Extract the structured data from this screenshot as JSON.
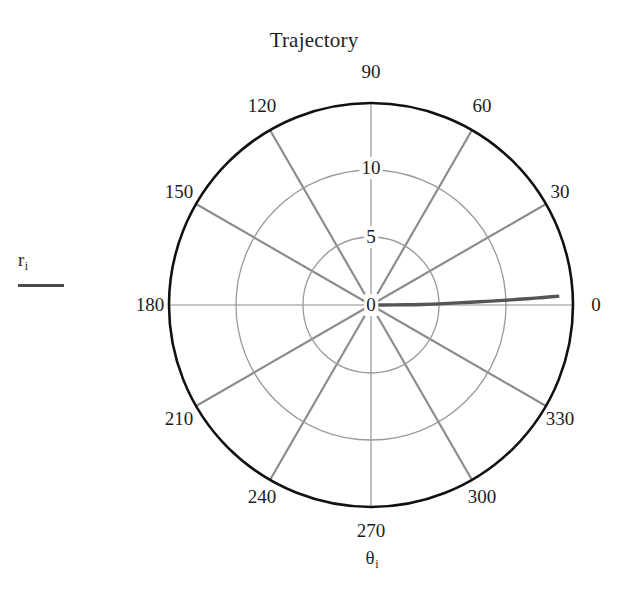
{
  "chart_data": {
    "type": "line",
    "projection": "polar",
    "title": "Trajectory",
    "xlabel": "θ",
    "xlabel_sub": "i",
    "ylabel": "r",
    "ylabel_sub": "i",
    "theta_unit": "degrees",
    "theta_ticks": [
      0,
      30,
      60,
      90,
      120,
      150,
      180,
      210,
      240,
      270,
      300,
      330
    ],
    "theta_tick_labels": [
      "0",
      "30",
      "60",
      "90",
      "120",
      "150",
      "180",
      "210",
      "240",
      "270",
      "300",
      "330"
    ],
    "r_ticks": [
      0,
      5,
      10
    ],
    "r_tick_labels": [
      "0",
      "5",
      "10"
    ],
    "rlim": [
      0,
      15
    ],
    "grid": true,
    "legend_position": "left",
    "series": [
      {
        "name": "r_i",
        "color": "#555555",
        "theta": [
          0.0,
          0.1,
          0.2,
          0.3,
          0.4,
          0.5,
          0.8,
          1.1,
          1.3,
          1.5,
          1.6,
          1.7,
          1.8,
          1.9,
          2.0,
          2.1,
          2.2,
          2.3,
          2.4,
          2.5,
          2.6,
          2.7
        ],
        "r": [
          0.0,
          0.9,
          1.8,
          2.6,
          3.2,
          3.8,
          4.6,
          5.4,
          6.1,
          6.8,
          7.4,
          8.0,
          8.6,
          9.2,
          9.8,
          10.4,
          11.0,
          11.6,
          12.2,
          12.8,
          13.4,
          14.0
        ]
      }
    ]
  },
  "geometry": {
    "cx": 371,
    "cy": 305,
    "r_outer": 202,
    "r_grid_10": 135,
    "r_grid_5": 68
  },
  "colors": {
    "outer_circle": "#111111",
    "grid": "#9a9a9a",
    "spoke": "#8c8c8c",
    "trace": "#555555",
    "text": "#1d1d1d"
  },
  "labels": {
    "angular": [
      {
        "text": "0",
        "x": 596,
        "y": 305
      },
      {
        "text": "30",
        "x": 560,
        "y": 192
      },
      {
        "text": "60",
        "x": 482,
        "y": 106
      },
      {
        "text": "90",
        "x": 371,
        "y": 72
      },
      {
        "text": "120",
        "x": 262,
        "y": 106
      },
      {
        "text": "150",
        "x": 179,
        "y": 192
      },
      {
        "text": "180",
        "x": 150,
        "y": 305
      },
      {
        "text": "210",
        "x": 179,
        "y": 419
      },
      {
        "text": "240",
        "x": 262,
        "y": 497
      },
      {
        "text": "270",
        "x": 371,
        "y": 531
      },
      {
        "text": "300",
        "x": 482,
        "y": 497
      },
      {
        "text": "330",
        "x": 560,
        "y": 419
      }
    ],
    "radial": [
      {
        "text": "10",
        "x": 371,
        "y": 168
      },
      {
        "text": "5",
        "x": 371,
        "y": 237
      },
      {
        "text": "0",
        "x": 371,
        "y": 305
      }
    ]
  }
}
